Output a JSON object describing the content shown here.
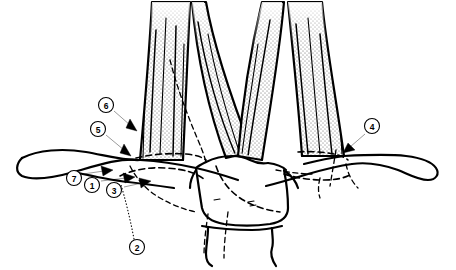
{
  "figure": {
    "type": "labeled-line-art",
    "background_color": "#ffffff",
    "line_color": "#000000",
    "shading_color": "#d8d8d8"
  },
  "callouts": [
    {
      "id": "callout-1",
      "number": "1",
      "circle": {
        "cx": 92,
        "cy": 185,
        "r": 7.5
      },
      "pointer": {
        "type": "arrow",
        "x1": 104,
        "y1": 180,
        "x2": 134,
        "y2": 176
      }
    },
    {
      "id": "callout-2",
      "number": "2",
      "circle": {
        "cx": 137,
        "cy": 247,
        "r": 7.5
      },
      "pointer": {
        "type": "dotted-leader",
        "x1": 134,
        "y1": 239,
        "x2": 121,
        "y2": 185
      }
    },
    {
      "id": "callout-3",
      "number": "3",
      "circle": {
        "cx": 114,
        "cy": 190,
        "r": 7.5
      },
      "pointer": {
        "type": "arrow",
        "x1": 126,
        "y1": 186,
        "x2": 148,
        "y2": 180
      }
    },
    {
      "id": "callout-4",
      "number": "4",
      "circle": {
        "cx": 372,
        "cy": 126,
        "r": 7.5
      },
      "pointer": {
        "type": "arrow",
        "x1": 364,
        "y1": 133,
        "x2": 345,
        "y2": 150
      }
    },
    {
      "id": "callout-5",
      "number": "5",
      "circle": {
        "cx": 98,
        "cy": 129,
        "r": 7.5
      },
      "pointer": {
        "type": "arrow",
        "x1": 107,
        "y1": 135,
        "x2": 130,
        "y2": 154
      }
    },
    {
      "id": "callout-6",
      "number": "6",
      "circle": {
        "cx": 106,
        "cy": 105,
        "r": 7.5
      },
      "pointer": {
        "type": "arrow",
        "x1": 115,
        "y1": 111,
        "x2": 135,
        "y2": 128
      }
    },
    {
      "id": "callout-7",
      "number": "7",
      "circle": {
        "cx": 74,
        "cy": 178,
        "r": 7.5
      },
      "pointer": {
        "type": "arrow",
        "x1": 85,
        "y1": 174,
        "x2": 113,
        "y2": 170
      }
    }
  ],
  "structures": [
    {
      "id": "muscle-left",
      "name": "left-muscle-bundle",
      "shaded": true
    },
    {
      "id": "muscle-right",
      "name": "right-muscle-bundle",
      "shaded": true
    },
    {
      "id": "transverse-process-left",
      "name": "left-transverse-process",
      "shaded": false
    },
    {
      "id": "transverse-process-right",
      "name": "right-transverse-process",
      "shaded": false
    },
    {
      "id": "vertebral-body",
      "name": "central-vertebral-body",
      "shaded": false
    },
    {
      "id": "inferior-segment",
      "name": "inferior-vertebral-segment",
      "shaded": false
    }
  ]
}
